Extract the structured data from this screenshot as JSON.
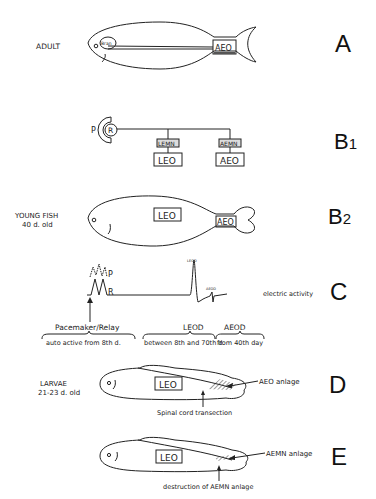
{
  "panels": {
    "A": {
      "letter": "A",
      "stage_label": "ADULT",
      "bran_label": "Bran",
      "organ_label": "AEO"
    },
    "B1": {
      "letter": "B",
      "subscript": "1",
      "pacemaker": "P",
      "relay": "R",
      "nuclei": [
        "LEMN",
        "AEMN"
      ],
      "organs": [
        "LEO",
        "AEO"
      ]
    },
    "B2": {
      "letter": "B",
      "subscript": "2",
      "stage_label": "YOUNG FISH",
      "age_label": "40 d. old",
      "organ_labels": [
        "LEO",
        "AEO"
      ]
    },
    "C": {
      "letter": "C",
      "trace_labels": {
        "p": "P",
        "r": "R",
        "leod": "LEOD",
        "aeod": "AEOD"
      },
      "side_label": "electric activity",
      "groups": [
        {
          "title": "Pacemaker/Relay",
          "note": "auto active from 8th d."
        },
        {
          "title": "LEOD",
          "note": "between 8th and 70th d."
        },
        {
          "title": "AEOD",
          "note": "from 40th day"
        }
      ]
    },
    "D": {
      "letter": "D",
      "stage_label": "LARVAE",
      "age_label": "21-23 d. old",
      "organ_label": "LEO",
      "anlage_label": "AEO  anlage",
      "procedure_label": "Spinal cord transection"
    },
    "E": {
      "letter": "E",
      "organ_label": "LEO",
      "anlage_label": "AEMN anlage",
      "procedure_label": "destruction of AEMN anlage"
    }
  }
}
